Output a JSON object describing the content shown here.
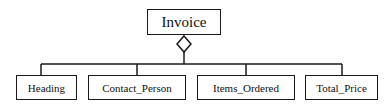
{
  "diagram": {
    "type": "UML aggregation",
    "root": {
      "label": "Invoice"
    },
    "relationship": "aggregation-diamond",
    "children": [
      {
        "label": "Heading"
      },
      {
        "label": "Contact_Person"
      },
      {
        "label": "Items_Ordered"
      },
      {
        "label": "Total_Price"
      }
    ],
    "colors": {
      "stroke": "#1a1a1a",
      "background": "#ffffff"
    }
  }
}
